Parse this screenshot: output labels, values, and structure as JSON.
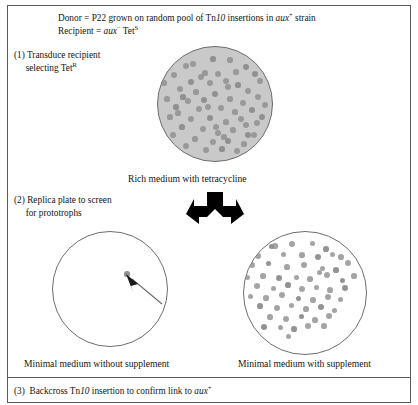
{
  "figure": {
    "border_color": "#5a5a5a",
    "plate_fill_rich": "#c9c9c9",
    "plate_fill_minimal": "#ffffff",
    "colony_color": "#8d8d8d"
  },
  "premise": {
    "line1_a": "Donor = P22 grown on random pool of Tn",
    "line1_ital": "10",
    "line1_b": " insertions in ",
    "line1_gene": "aux",
    "line1_sup": "+",
    "line1_c": " strain",
    "line2_a": "Recipient = ",
    "line2_gene": "aux",
    "line2_sup1": "−",
    "line2_b": " Tet",
    "line2_sup2": "S"
  },
  "steps": [
    {
      "number": "(1)",
      "line1": "Transduce recipient",
      "line2_a": "selecting Tet",
      "line2_sup": "R"
    },
    {
      "number": "(2)",
      "line1": "Replica plate to screen",
      "line2_a": "for prototrophs",
      "line2_sup": ""
    },
    {
      "number": "(3)",
      "line1_a": "Backcross Tn",
      "line1_ital": "10",
      "line1_b": " insertion to confirm link to ",
      "line1_gene": "aux",
      "line1_sup": "+"
    }
  ],
  "plates": [
    {
      "id": "rich-tetracycline",
      "caption": "Rich medium with tetracycline",
      "medium": "rich",
      "supplement": "tetracycline",
      "fill": "#c9c9c9",
      "colony_count": 62,
      "colonies": [
        [
          55,
          12
        ],
        [
          35,
          17
        ],
        [
          28,
          19
        ],
        [
          72,
          13
        ],
        [
          88,
          20
        ],
        [
          16,
          28
        ],
        [
          47,
          26
        ],
        [
          60,
          27
        ],
        [
          97,
          27
        ],
        [
          6,
          36
        ],
        [
          52,
          36
        ],
        [
          68,
          34
        ],
        [
          80,
          38
        ],
        [
          102,
          34
        ],
        [
          22,
          42
        ],
        [
          38,
          45
        ],
        [
          57,
          47
        ],
        [
          90,
          44
        ],
        [
          9,
          52
        ],
        [
          30,
          54
        ],
        [
          46,
          53
        ],
        [
          72,
          52
        ],
        [
          85,
          56
        ],
        [
          100,
          50
        ],
        [
          18,
          60
        ],
        [
          41,
          62
        ],
        [
          63,
          61
        ],
        [
          77,
          65
        ],
        [
          94,
          63
        ],
        [
          107,
          58
        ],
        [
          12,
          70
        ],
        [
          33,
          72
        ],
        [
          52,
          71
        ],
        [
          68,
          75
        ],
        [
          83,
          72
        ],
        [
          99,
          76
        ],
        [
          24,
          80
        ],
        [
          45,
          82
        ],
        [
          60,
          86
        ],
        [
          75,
          83
        ],
        [
          90,
          88
        ],
        [
          15,
          88
        ],
        [
          37,
          92
        ],
        [
          55,
          95
        ],
        [
          70,
          94
        ],
        [
          86,
          97
        ],
        [
          28,
          99
        ],
        [
          48,
          103
        ],
        [
          64,
          102
        ],
        [
          79,
          104
        ],
        [
          96,
          88
        ],
        [
          20,
          66
        ],
        [
          104,
          70
        ],
        [
          43,
          30
        ],
        [
          66,
          90
        ],
        [
          58,
          80
        ],
        [
          33,
          35
        ],
        [
          78,
          25
        ],
        [
          50,
          60
        ],
        [
          88,
          78
        ],
        [
          25,
          50
        ],
        [
          70,
          40
        ]
      ]
    },
    {
      "id": "minimal-without-supplement",
      "caption": "Minimal medium without supplement",
      "medium": "minimal",
      "supplement": "none",
      "fill": "#ffffff",
      "colony_count": 1,
      "colonies": [
        [
          74,
          42
        ]
      ],
      "annotation": "arrow pointing to single prototrophic colony"
    },
    {
      "id": "minimal-with-supplement",
      "caption": "Minimal medium with supplement",
      "medium": "minimal",
      "supplement": "present",
      "fill": "#ffffff",
      "colony_count": 58,
      "colonies": [
        [
          27,
          14
        ],
        [
          31,
          14
        ],
        [
          48,
          12
        ],
        [
          68,
          11
        ],
        [
          82,
          17
        ],
        [
          14,
          24
        ],
        [
          39,
          22
        ],
        [
          58,
          23
        ],
        [
          74,
          25
        ],
        [
          88,
          22
        ],
        [
          97,
          25
        ],
        [
          8,
          33
        ],
        [
          24,
          31
        ],
        [
          43,
          35
        ],
        [
          60,
          33
        ],
        [
          78,
          36
        ],
        [
          92,
          38
        ],
        [
          104,
          31
        ],
        [
          3,
          45
        ],
        [
          19,
          44
        ],
        [
          35,
          46
        ],
        [
          52,
          45
        ],
        [
          66,
          47
        ],
        [
          83,
          43
        ],
        [
          98,
          48
        ],
        [
          110,
          44
        ],
        [
          13,
          54
        ],
        [
          29,
          56
        ],
        [
          44,
          53
        ],
        [
          58,
          57
        ],
        [
          72,
          55
        ],
        [
          86,
          58
        ],
        [
          101,
          56
        ],
        [
          6,
          64
        ],
        [
          22,
          66
        ],
        [
          38,
          63
        ],
        [
          54,
          66
        ],
        [
          69,
          68
        ],
        [
          84,
          65
        ],
        [
          96,
          67
        ],
        [
          16,
          74
        ],
        [
          33,
          76
        ],
        [
          47,
          73
        ],
        [
          62,
          77
        ],
        [
          77,
          75
        ],
        [
          90,
          78
        ],
        [
          26,
          85
        ],
        [
          42,
          87
        ],
        [
          57,
          84
        ],
        [
          71,
          88
        ],
        [
          85,
          84
        ],
        [
          36,
          95
        ],
        [
          50,
          97
        ],
        [
          64,
          94
        ],
        [
          44,
          104
        ],
        [
          80,
          94
        ],
        [
          20,
          95
        ],
        [
          75,
          40
        ]
      ]
    }
  ],
  "fork_arrow": {
    "name": "split-arrow",
    "color": "#000000",
    "description": "Y-shaped arrow splitting downward into two branches"
  },
  "pointer_arrow": {
    "name": "colony-pointer-arrow",
    "color": "#6a6a6a",
    "description": "thin arrow pointing up-left at the single colony"
  }
}
